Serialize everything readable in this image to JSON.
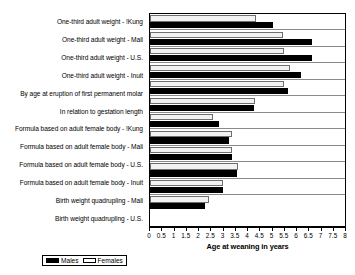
{
  "chart_data": {
    "type": "bar",
    "orientation": "horizontal",
    "title": "",
    "xlabel": "Age at weaning in years",
    "ylabel": "",
    "xlim": [
      0,
      8
    ],
    "xticks": [
      "0",
      "0.5",
      "1",
      "1.5",
      "2",
      "2.5",
      "3",
      "3.5",
      "4",
      "4.5",
      "5",
      "5.5",
      "6",
      "6.5",
      "7",
      "7.5",
      "8"
    ],
    "xtick_values": [
      0,
      0.5,
      1,
      1.5,
      2,
      2.5,
      3,
      3.5,
      4,
      4.5,
      5,
      5.5,
      6,
      6.5,
      7,
      7.5,
      8
    ],
    "grid": false,
    "legend_position": "bottom-left",
    "categories": [
      "One-third adult weight - !Kung",
      "One-third adult weight - Mali",
      "One-third adult weight - U.S.",
      "One-third adult weight - Inuit",
      "By age at eruption of first permanent molar",
      "In relation to gestation length",
      "Formula based on adult female body - !Kung",
      "Formula based on adult female body - Mali",
      "Formula based on adult female body - U.S.",
      "Formula based on adult female body - Inuit",
      "Birth weight quadrupling - Mali",
      "Birth weight quadrupling - U.S."
    ],
    "series": [
      {
        "name": "Males",
        "color": "#000000",
        "values": [
          5.05,
          6.65,
          6.65,
          6.2,
          5.65,
          4.25,
          2.85,
          3.25,
          3.35,
          3.55,
          3.0,
          2.25
        ]
      },
      {
        "name": "Females",
        "color": "#ffffff",
        "values": [
          4.35,
          5.45,
          5.5,
          5.75,
          5.5,
          4.3,
          2.6,
          3.35,
          3.35,
          3.6,
          3.0,
          2.4
        ]
      }
    ]
  },
  "legend": {
    "males_label": "Males",
    "females_label": "Females"
  }
}
